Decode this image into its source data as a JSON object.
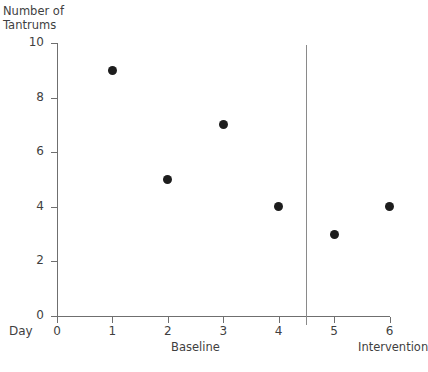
{
  "chart_data": {
    "type": "scatter",
    "title": "",
    "xlabel": "Day",
    "ylabel": "Number of\nTantrums",
    "x": [
      1,
      2,
      3,
      4,
      5,
      6
    ],
    "values": [
      9,
      5,
      7,
      4,
      3,
      4
    ],
    "xlim": [
      0,
      6
    ],
    "ylim": [
      0,
      10
    ],
    "x_ticks": [
      "0",
      "1",
      "2",
      "3",
      "4",
      "5",
      "6"
    ],
    "y_ticks": [
      "0",
      "2",
      "4",
      "6",
      "8",
      "10"
    ],
    "grid": false,
    "legend": "none",
    "series": [
      {
        "name": "Tantrums per day",
        "x": [
          1,
          2,
          3,
          4,
          5,
          6
        ],
        "values": [
          9,
          5,
          7,
          4,
          3,
          4
        ]
      }
    ],
    "annotations": [
      {
        "type": "phase-line",
        "x": 4.5,
        "label": ""
      },
      {
        "type": "phase-label",
        "text": "Baseline",
        "x_range": [
          0,
          4.5
        ]
      },
      {
        "type": "phase-label",
        "text": "Intervention",
        "x_range": [
          4.5,
          6
        ]
      }
    ],
    "marker_color": "#1d1d1d",
    "axis_color": "#6f6f6f"
  },
  "axes": {
    "y_title": "Number of\nTantrums",
    "x_caption": "Day",
    "y_ticks": [
      {
        "label": "10",
        "value": 10
      },
      {
        "label": "8",
        "value": 8
      },
      {
        "label": "6",
        "value": 6
      },
      {
        "label": "4",
        "value": 4
      },
      {
        "label": "2",
        "value": 2
      },
      {
        "label": "0",
        "value": 0
      }
    ],
    "x_ticks": [
      {
        "label": "0",
        "value": 0
      },
      {
        "label": "1",
        "value": 1
      },
      {
        "label": "2",
        "value": 2
      },
      {
        "label": "3",
        "value": 3
      },
      {
        "label": "4",
        "value": 4
      },
      {
        "label": "5",
        "value": 5
      },
      {
        "label": "6",
        "value": 6
      }
    ]
  },
  "phases": {
    "baseline_label": "Baseline",
    "intervention_label": "Intervention"
  },
  "title_strip": {
    "text": ""
  }
}
